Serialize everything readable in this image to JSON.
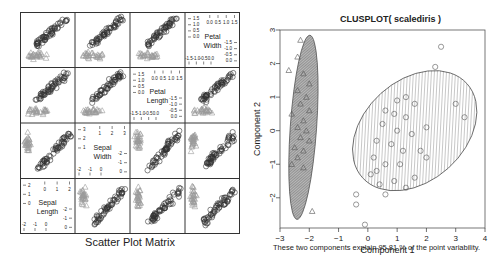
{
  "left_panel": {
    "caption": "Scatter Plot Matrix",
    "variables": [
      "Petal\nWidth",
      "Petal\nLength",
      "Sepal\nWidth",
      "Sepal\nLength"
    ],
    "var_labels": [
      {
        "line1": "Petal",
        "line2": "Width"
      },
      {
        "line1": "Petal",
        "line2": "Length"
      },
      {
        "line1": "Sepal",
        "line2": "Width"
      },
      {
        "line1": "Sepal",
        "line2": "Length"
      }
    ]
  },
  "right_panel": {
    "title": "CLUSPLOT( scalediris )",
    "xlabel": "Component 1",
    "ylabel": "Component 2",
    "note": "These two components explain 95.81 % of the point variability."
  },
  "chart_data": [
    {
      "type": "scatter",
      "title": "Scatter Plot Matrix",
      "subtype": "scatterplot-matrix",
      "variables": [
        "Petal Width",
        "Petal Length",
        "Sepal Width",
        "Sepal Length"
      ],
      "groups": [
        {
          "name": "cluster 1",
          "marker": "triangle",
          "color": "#9a9a9a"
        },
        {
          "name": "cluster 2",
          "marker": "circle",
          "color": "#333333"
        }
      ],
      "diagonal_axes": {
        "Petal Width": {
          "upper_ticks": [
            "0.0",
            "0.5",
            "1.0",
            "1.5"
          ],
          "lower_ticks": [
            "-1.5",
            "-1.0",
            "-0.5",
            "0.0"
          ],
          "right_ticks": [
            "0.0",
            "0.5",
            "1.0",
            "1.5"
          ],
          "left_ticks": [
            "-1.5",
            "-0.5"
          ]
        },
        "Petal Length": {
          "upper_ticks": [
            "0.0",
            "0.5",
            "1.0",
            "1.5"
          ],
          "lower_ticks": [
            "-1.5",
            "-1.0",
            "-0.5",
            "0.0"
          ],
          "left_ticks": [
            "-1.5",
            "-0.5"
          ]
        },
        "Sepal Width": {
          "upper_ticks": [
            "1",
            "2",
            "3"
          ],
          "lower_ticks": [
            "-2",
            "-1",
            "0"
          ]
        },
        "Sepal Length": {
          "upper_ticks": [
            "0",
            "1",
            "2"
          ],
          "lower_ticks": [
            "-2",
            "-1",
            "0"
          ]
        }
      },
      "grid": false,
      "legend": "none"
    },
    {
      "type": "scatter",
      "title": "CLUSPLOT( scalediris )",
      "xlabel": "Component 1",
      "ylabel": "Component 2",
      "xlim": [
        -3,
        4
      ],
      "ylim": [
        -2.9,
        3
      ],
      "xticks": [
        -3,
        -2,
        -1,
        0,
        1,
        2,
        3,
        4
      ],
      "yticks": [
        -2,
        -1,
        0,
        1,
        2,
        3
      ],
      "annotation": "These two components explain 95.81 % of the point variability.",
      "clusters": [
        {
          "name": "cluster 1",
          "marker": "triangle",
          "ellipse": {
            "cx": -2.2,
            "cy": 0.1,
            "rx": 0.45,
            "ry": 2.75,
            "angle_deg": -4,
            "fill": "dense-hatch",
            "color": "#8a8a8a"
          },
          "points": [
            [
              -2.3,
              2.7
            ],
            [
              -2.4,
              2.2
            ],
            [
              -2.7,
              1.8
            ],
            [
              -2.2,
              1.7
            ],
            [
              -2.0,
              1.4
            ],
            [
              -2.4,
              1.2
            ],
            [
              -2.1,
              1.0
            ],
            [
              -2.3,
              0.8
            ],
            [
              -2.6,
              0.5
            ],
            [
              -2.0,
              0.6
            ],
            [
              -2.2,
              0.3
            ],
            [
              -2.4,
              0.1
            ],
            [
              -2.1,
              0.0
            ],
            [
              -2.3,
              -0.2
            ],
            [
              -2.0,
              -0.3
            ],
            [
              -2.5,
              -0.5
            ],
            [
              -2.2,
              -0.6
            ],
            [
              -2.4,
              -0.8
            ],
            [
              -2.6,
              -1.0
            ],
            [
              -2.2,
              -1.1
            ],
            [
              -1.9,
              -2.4
            ]
          ]
        },
        {
          "name": "cluster 2",
          "marker": "circle",
          "ellipse": {
            "cx": 1.6,
            "cy": 0.0,
            "rx": 2.4,
            "ry": 1.5,
            "angle_deg": 42,
            "fill": "hatch",
            "color": "#9a9a9a"
          },
          "points": [
            [
              2.5,
              2.5
            ],
            [
              2.3,
              1.9
            ],
            [
              3.0,
              0.8
            ],
            [
              3.3,
              0.4
            ],
            [
              1.0,
              0.9
            ],
            [
              1.3,
              1.0
            ],
            [
              1.6,
              0.8
            ],
            [
              0.6,
              0.6
            ],
            [
              0.9,
              0.5
            ],
            [
              1.3,
              0.4
            ],
            [
              0.5,
              0.2
            ],
            [
              1.0,
              0.0
            ],
            [
              1.5,
              -0.1
            ],
            [
              2.0,
              0.1
            ],
            [
              0.3,
              -0.3
            ],
            [
              0.8,
              -0.4
            ],
            [
              1.2,
              -0.6
            ],
            [
              1.8,
              -0.6
            ],
            [
              0.2,
              -0.8
            ],
            [
              0.6,
              -1.0
            ],
            [
              1.1,
              -1.0
            ],
            [
              2.0,
              -0.8
            ],
            [
              0.1,
              -1.3
            ],
            [
              0.4,
              -1.6
            ],
            [
              0.9,
              -1.5
            ],
            [
              1.3,
              -1.7
            ],
            [
              0.6,
              -1.9
            ],
            [
              -0.4,
              -1.9
            ],
            [
              -0.4,
              -2.2
            ],
            [
              -0.1,
              -2.8
            ],
            [
              0.3,
              -1.2
            ],
            [
              1.6,
              -1.4
            ]
          ]
        }
      ]
    }
  ]
}
